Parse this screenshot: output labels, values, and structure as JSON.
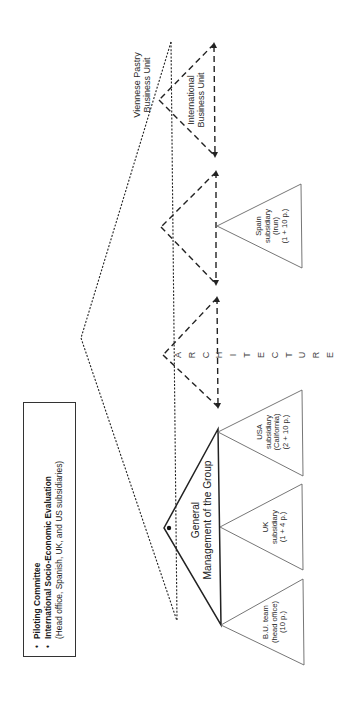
{
  "legend": {
    "items": [
      {
        "bullet": "•",
        "label": "Piloting Committee"
      },
      {
        "bullet": "•",
        "label": "International Socio-Economic Evaluation"
      }
    ],
    "note": "(Head office, Spanish, UK, and US subsidiaries)"
  },
  "business_units": {
    "viennese_pastry": {
      "line1": "Viennese Pastry",
      "line2": "Business Unit"
    },
    "international": {
      "line1": "International",
      "line2": "Business Unit"
    }
  },
  "architecture_label": [
    "A",
    "R",
    "C",
    "H",
    "I",
    "T",
    "E",
    "C",
    "T",
    "U",
    "R",
    "E"
  ],
  "general_management": {
    "line1": "General",
    "line2": "Management of the Group"
  },
  "subsidiaries": [
    {
      "id": "spain",
      "lines": [
        "Spain",
        "subsidiary",
        "(Irun)",
        "(1 + 10 p.)"
      ]
    },
    {
      "id": "usa",
      "lines": [
        "USA",
        "subsidiary",
        "(California)",
        "(2 + 10 p.)"
      ]
    },
    {
      "id": "uk",
      "lines": [
        "UK",
        "subsidiary",
        "(1 + 4 p.)"
      ]
    },
    {
      "id": "bu-team",
      "lines": [
        "B.U. team",
        "(head office)",
        "(10 p.)"
      ]
    }
  ],
  "colors": {
    "line": "#222222",
    "thin_line": "#555555",
    "background": "#ffffff"
  }
}
